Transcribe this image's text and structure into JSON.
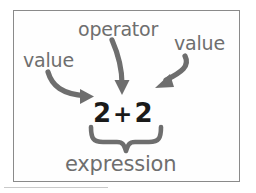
{
  "diagram": {
    "expression": {
      "left_value": "2",
      "operator": "+",
      "right_value": "2",
      "full_text": "2 + 2"
    },
    "labels": {
      "value_left": "value",
      "operator": "operator",
      "value_right": "value",
      "expression": "expression"
    },
    "annotations": [
      {
        "name": "arrow-left-value",
        "label": "value",
        "points_to": "left operand 2",
        "style": "curved arrow, left to right, downward"
      },
      {
        "name": "arrow-operator",
        "label": "operator",
        "points_to": "plus sign",
        "style": "curved arrow, downward"
      },
      {
        "name": "arrow-right-value",
        "label": "value",
        "points_to": "right operand 2",
        "style": "curved arrow, right to left, downward"
      },
      {
        "name": "brace-expression",
        "label": "expression",
        "spans": "2 + 2",
        "style": "underbrace"
      }
    ],
    "colors": {
      "label_gray": "#6e6e6e",
      "expression_black": "#1a1a1a",
      "stroke_gray": "#6e6e6e",
      "frame_border": "#8a8a8a",
      "background": "#ffffff"
    }
  }
}
